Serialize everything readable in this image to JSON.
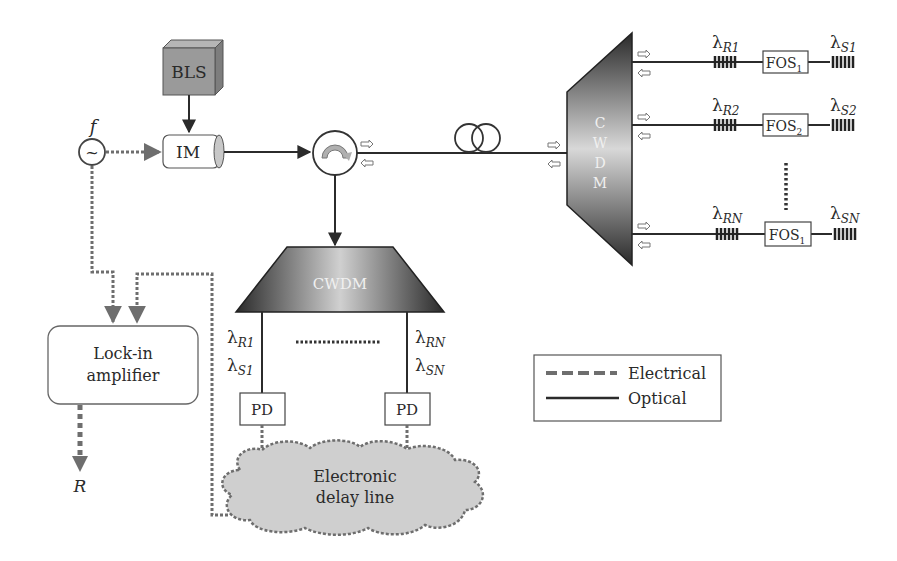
{
  "diagram": {
    "components": {
      "source": {
        "label": "BLS"
      },
      "modulator": {
        "label": "IM"
      },
      "oscillator": {
        "label": "f",
        "symbol": "~"
      },
      "mux_right": {
        "letters": [
          "C",
          "W",
          "D",
          "M"
        ]
      },
      "mux_bottom": {
        "label": "CWDM"
      },
      "lockin": {
        "line1": "Lock-in",
        "line2": "amplifier"
      },
      "output": {
        "label": "R"
      },
      "pd_left": {
        "label": "PD"
      },
      "pd_right": {
        "label": "PD"
      },
      "delay": {
        "line1": "Electronic",
        "line2": "delay line"
      }
    },
    "branches": [
      {
        "ref": "λ",
        "ref_sub": "R1",
        "fos": "FOS",
        "fos_sub": "1",
        "sig": "λ",
        "sig_sub": "S1"
      },
      {
        "ref": "λ",
        "ref_sub": "R2",
        "fos": "FOS",
        "fos_sub": "2",
        "sig": "λ",
        "sig_sub": "S2"
      },
      {
        "ref": "λ",
        "ref_sub": "RN",
        "fos": "FOS",
        "fos_sub": "1",
        "sig": "λ",
        "sig_sub": "SN"
      }
    ],
    "demux_labels": {
      "left": {
        "r": "λ",
        "r_sub": "R1",
        "s": "λ",
        "s_sub": "S1"
      },
      "right": {
        "r": "λ",
        "r_sub": "RN",
        "s": "λ",
        "s_sub": "SN"
      }
    },
    "legend": {
      "items": [
        {
          "label": "Electrical",
          "style": "dashed"
        },
        {
          "label": "Optical",
          "style": "solid"
        }
      ]
    },
    "colors": {
      "optical_line": "#2b2b2b",
      "electrical_line": "#6e6e6e",
      "bls_fill": "#9a9a9a",
      "cloud_fill": "#cfcfcf",
      "cwdm_dark": "#2a2a2a",
      "cwdm_light": "#d8d8d8"
    }
  }
}
